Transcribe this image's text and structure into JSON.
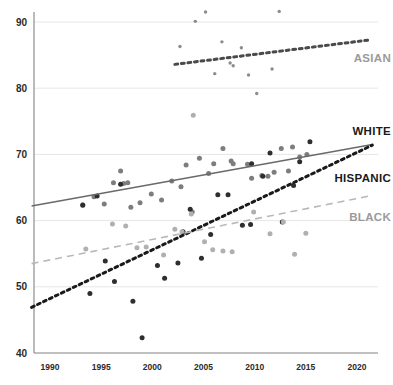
{
  "chart_data": {
    "type": "scatter",
    "title": "",
    "subtitle": "",
    "xlabel": "",
    "ylabel": "",
    "xlim": [
      1988,
      2022
    ],
    "ylim": [
      38,
      92
    ],
    "xticks": [
      1990,
      1995,
      2000,
      2005,
      2010,
      2015,
      2020
    ],
    "yticks": [
      40,
      50,
      60,
      70,
      80,
      90
    ],
    "grid": "horizontal",
    "legend_position": "inline-right",
    "series": [
      {
        "name": "ASIAN",
        "label": "ASIAN",
        "color": "#9a9a9a",
        "marker_color": "#8c8c8c",
        "line_style": "dotted",
        "line_color": "#4a4a4a",
        "trend_start": [
          2002.2,
          83.6
        ],
        "trend_end": [
          2021.3,
          87.3
        ],
        "points": [
          [
            2002.7,
            86.3
          ],
          [
            2004.2,
            90.1
          ],
          [
            2005.2,
            91.5
          ],
          [
            2006.1,
            82.2
          ],
          [
            2006.8,
            87.0
          ],
          [
            2007.6,
            83.8
          ],
          [
            2007.9,
            83.4
          ],
          [
            2008.7,
            86.1
          ],
          [
            2009.4,
            82.0
          ],
          [
            2010.2,
            79.2
          ],
          [
            2011.7,
            82.9
          ],
          [
            2012.4,
            91.6
          ]
        ]
      },
      {
        "name": "WHITE",
        "label": "WHITE",
        "color": "#1a1a1a",
        "marker_color": "#7d7d7d",
        "line_style": "solid",
        "line_color": "#6a6a6a",
        "trend_start": [
          1988.2,
          62.2
        ],
        "trend_end": [
          2021.5,
          71.5
        ],
        "points": [
          [
            1993.2,
            62.4
          ],
          [
            1994.3,
            63.6
          ],
          [
            1995.3,
            62.5
          ],
          [
            1996.2,
            65.7
          ],
          [
            1996.9,
            67.5
          ],
          [
            1997.2,
            65.6
          ],
          [
            1997.6,
            65.7
          ],
          [
            1997.9,
            62.0
          ],
          [
            1998.8,
            62.7
          ],
          [
            1999.9,
            64.0
          ],
          [
            2000.9,
            63.1
          ],
          [
            2001.9,
            66.0
          ],
          [
            2002.8,
            65.1
          ],
          [
            2003.3,
            68.4
          ],
          [
            2003.9,
            61.3
          ],
          [
            2004.6,
            69.4
          ],
          [
            2005.5,
            67.1
          ],
          [
            2006.0,
            68.6
          ],
          [
            2006.9,
            70.9
          ],
          [
            2007.7,
            69.0
          ],
          [
            2007.9,
            68.6
          ],
          [
            2009.3,
            68.5
          ],
          [
            2009.7,
            66.4
          ],
          [
            2010.7,
            66.8
          ],
          [
            2011.3,
            66.7
          ],
          [
            2011.9,
            67.3
          ],
          [
            2012.6,
            70.9
          ],
          [
            2013.3,
            67.5
          ],
          [
            2013.7,
            71.1
          ],
          [
            2014.4,
            69.6
          ],
          [
            2015.1,
            70.0
          ]
        ]
      },
      {
        "name": "HISPANIC",
        "label": "HISPANIC",
        "color": "#1a1a1a",
        "marker_color": "#2e2e2e",
        "line_style": "dotted",
        "line_color": "#1a1a1a",
        "trend_start": [
          1988.2,
          46.9
        ],
        "trend_end": [
          2021.5,
          71.4
        ],
        "points": [
          [
            1993.2,
            62.3
          ],
          [
            1993.9,
            49.0
          ],
          [
            1994.6,
            63.7
          ],
          [
            1995.4,
            53.9
          ],
          [
            1996.3,
            50.8
          ],
          [
            1996.9,
            65.5
          ],
          [
            1998.1,
            47.8
          ],
          [
            1999.0,
            42.3
          ],
          [
            2000.5,
            53.2
          ],
          [
            2001.2,
            51.3
          ],
          [
            2002.5,
            53.6
          ],
          [
            2003.0,
            58.3
          ],
          [
            2003.7,
            61.7
          ],
          [
            2004.8,
            54.3
          ],
          [
            2005.7,
            57.9
          ],
          [
            2006.4,
            63.9
          ],
          [
            2007.4,
            63.9
          ],
          [
            2008.8,
            59.3
          ],
          [
            2009.6,
            59.4
          ],
          [
            2010.8,
            66.7
          ],
          [
            2011.5,
            70.2
          ],
          [
            2012.7,
            59.8
          ],
          [
            2013.8,
            65.3
          ],
          [
            2014.4,
            68.9
          ],
          [
            2015.4,
            71.9
          ],
          [
            2009.7,
            68.6
          ]
        ]
      },
      {
        "name": "BLACK",
        "label": "BLACK",
        "color": "#b5b5b5",
        "marker_color": "#b0b0b0",
        "line_style": "dashed",
        "line_color": "#b8b8b8",
        "trend_start": [
          1988.2,
          53.5
        ],
        "trend_end": [
          2021.5,
          63.8
        ],
        "points": [
          [
            1993.5,
            55.7
          ],
          [
            1996.1,
            59.5
          ],
          [
            1997.4,
            59.2
          ],
          [
            1998.5,
            55.9
          ],
          [
            1999.4,
            56.0
          ],
          [
            2001.1,
            54.8
          ],
          [
            2002.2,
            58.7
          ],
          [
            2003.8,
            61.0
          ],
          [
            2005.1,
            56.8
          ],
          [
            2005.9,
            55.6
          ],
          [
            2006.9,
            55.4
          ],
          [
            2007.8,
            55.3
          ],
          [
            2009.9,
            61.3
          ],
          [
            2011.5,
            58.0
          ],
          [
            2012.8,
            59.8
          ],
          [
            2013.9,
            54.9
          ],
          [
            2015.0,
            58.1
          ],
          [
            2004.0,
            75.9
          ],
          [
            2002.9,
            58.3
          ]
        ]
      }
    ]
  },
  "axis": {
    "x_tick_labels": [
      "1990",
      "1995",
      "2000",
      "2005",
      "2010",
      "2015",
      "2020"
    ],
    "y_tick_labels": [
      "40",
      "50",
      "60",
      "70",
      "80",
      "90"
    ]
  },
  "labels": {
    "asian": "ASIAN",
    "white": "WHITE",
    "hispanic": "HISPANIC",
    "black": "BLACK"
  },
  "colors": {
    "asian": "#9a9a9a",
    "white": "#1a1a1a",
    "hispanic": "#1a1a1a",
    "black": "#b5b5b5",
    "axis": "#8d8d8d",
    "grid": "#e6e6e6",
    "background": "#ffffff"
  }
}
